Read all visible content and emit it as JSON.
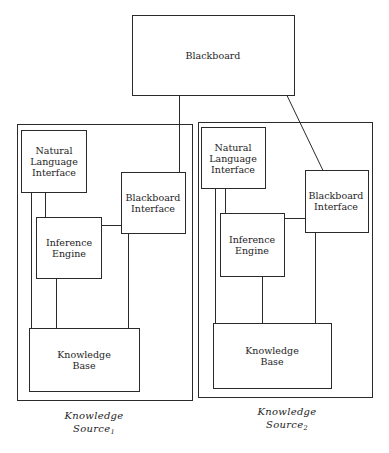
{
  "diagram": {
    "blackboard": {
      "label": "Blackboard"
    },
    "sources": [
      {
        "nl_interface": [
          "Natural",
          "Language",
          "Interface"
        ],
        "bb_interface": [
          "Blackboard",
          "Interface"
        ],
        "inference": [
          "Inference",
          "Engine"
        ],
        "knowledge_base": [
          "Knowledge",
          "Base"
        ],
        "caption": {
          "line1": "Knowledge",
          "line2": "Source",
          "subscript": "1"
        }
      },
      {
        "nl_interface": [
          "Natural",
          "Language",
          "Interface"
        ],
        "bb_interface": [
          "Blackboard",
          "Interface"
        ],
        "inference": [
          "Inference",
          "Engine"
        ],
        "knowledge_base": [
          "Knowledge",
          "Base"
        ],
        "caption": {
          "line1": "Knowledge",
          "line2": "Source",
          "subscript": "2"
        }
      }
    ],
    "colors": {
      "stroke": "#2a2a2a",
      "text": "#1e1e1e",
      "background": "#ffffff"
    }
  }
}
